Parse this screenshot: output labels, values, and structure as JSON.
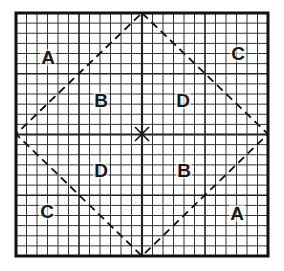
{
  "diagram": {
    "grid": {
      "x0": 16,
      "y0": 13,
      "x1": 268,
      "y1": 256,
      "cells": 24,
      "major_every": 6,
      "line_color": "#333333",
      "border_color": "#111111"
    },
    "diamond": {
      "points": [
        [
          142,
          13
        ],
        [
          268,
          134
        ],
        [
          142,
          256
        ],
        [
          16,
          134
        ]
      ],
      "dash": "8 5",
      "color": "#111111"
    },
    "center_mark": {
      "x": 142,
      "y": 134,
      "size": 7,
      "symbol": "x"
    },
    "labels": [
      {
        "text": "A",
        "x": 48,
        "y": 64
      },
      {
        "text": "C",
        "x": 238,
        "y": 60
      },
      {
        "text": "B",
        "x": 101,
        "y": 107
      },
      {
        "text": "D",
        "x": 183,
        "y": 107
      },
      {
        "text": "D",
        "x": 101,
        "y": 177
      },
      {
        "text": "B",
        "x": 184,
        "y": 177
      },
      {
        "text": "C",
        "x": 47,
        "y": 218
      },
      {
        "text": "A",
        "x": 237,
        "y": 220
      }
    ]
  }
}
